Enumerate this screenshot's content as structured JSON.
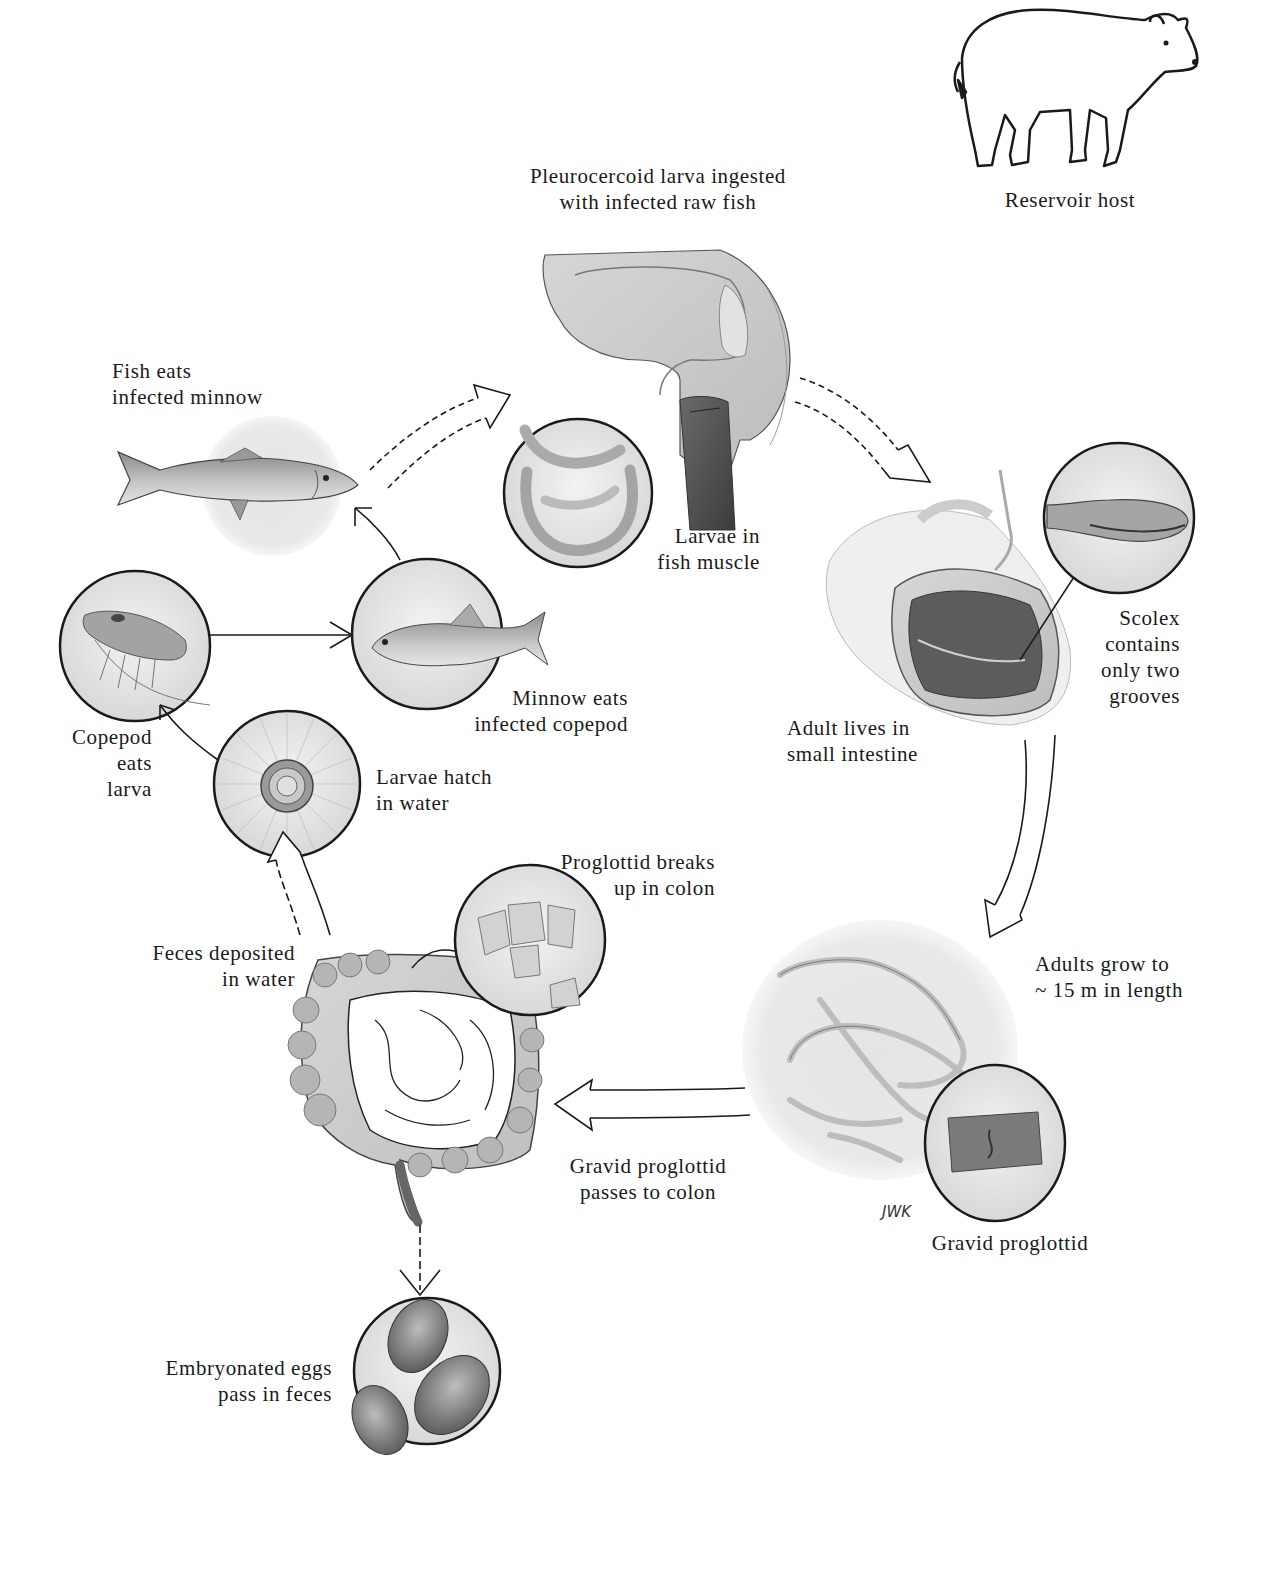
{
  "diagram": {
    "type": "life-cycle",
    "colors": {
      "ink": "#1a1a1a",
      "tissue": "#c9c9c9",
      "background": "#ffffff",
      "halo": "#e6e6e6"
    },
    "labels": {
      "ingestion": [
        "Pleurocercoid larva ingested",
        "with infected raw fish"
      ],
      "reservoir": [
        "Reservoir host"
      ],
      "fish_eats": [
        "Fish eats",
        "infected minnow"
      ],
      "larvae_muscle": [
        "Larvae in",
        "fish muscle"
      ],
      "scolex": [
        "Scolex",
        "contains",
        "only two",
        "grooves"
      ],
      "adult_intestine": [
        "Adult lives in",
        "small intestine"
      ],
      "minnow_eats": [
        "Minnow eats",
        "infected copepod"
      ],
      "copepod_eats": [
        "Copepod",
        "eats",
        "larva"
      ],
      "larvae_hatch": [
        "Larvae hatch",
        "in water"
      ],
      "proglottid_breaks": [
        "Proglottid breaks",
        "up in colon"
      ],
      "feces_deposited": [
        "Feces deposited",
        "in water"
      ],
      "adults_grow": [
        "Adults grow to",
        "~ 15 m in length"
      ],
      "gravid_passes": [
        "Gravid proglottid",
        "passes to colon"
      ],
      "gravid_proglottid": [
        "Gravid proglottid"
      ],
      "eggs_pass": [
        "Embryonated eggs",
        "pass in feces"
      ],
      "signature": "JWK"
    },
    "nodes": [
      {
        "id": "human-head",
        "desc": "Sagittal section of human head/throat"
      },
      {
        "id": "small-intestine",
        "desc": "Opened small intestine with adult worm"
      },
      {
        "id": "scolex-inset",
        "desc": "Magnified scolex with groove"
      },
      {
        "id": "adult-worm",
        "desc": "Coiled adult tapeworm"
      },
      {
        "id": "gravid-inset",
        "desc": "Magnified gravid proglottid"
      },
      {
        "id": "colon",
        "desc": "Human large and small intestine"
      },
      {
        "id": "proglottid-inset",
        "desc": "Proglottid segments breaking up"
      },
      {
        "id": "eggs-inset",
        "desc": "Embryonated eggs"
      },
      {
        "id": "larva-inset",
        "desc": "Hatched coracidium larva"
      },
      {
        "id": "copepod-inset",
        "desc": "Copepod"
      },
      {
        "id": "minnow-inset",
        "desc": "Minnow"
      },
      {
        "id": "fish",
        "desc": "Predator fish"
      },
      {
        "id": "larvae-inset",
        "desc": "Plerocercoid larvae in fish muscle"
      },
      {
        "id": "bear",
        "desc": "Bear reservoir host"
      }
    ],
    "edges": [
      [
        "fish",
        "human-head"
      ],
      [
        "human-head",
        "small-intestine"
      ],
      [
        "small-intestine",
        "adult-worm"
      ],
      [
        "adult-worm",
        "colon"
      ],
      [
        "colon",
        "eggs-inset"
      ],
      [
        "colon",
        "larva-inset"
      ],
      [
        "larva-inset",
        "copepod-inset"
      ],
      [
        "copepod-inset",
        "minnow-inset"
      ],
      [
        "minnow-inset",
        "fish"
      ]
    ]
  }
}
